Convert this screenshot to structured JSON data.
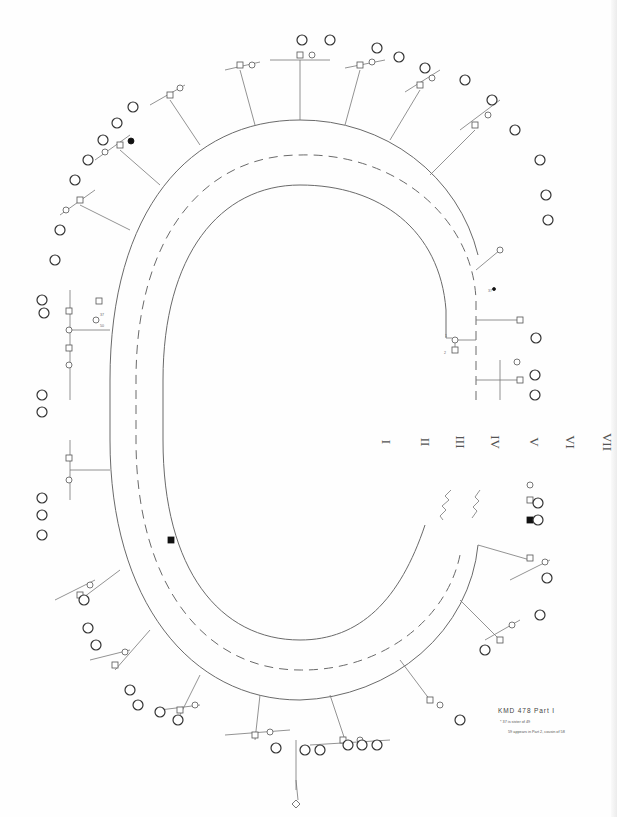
{
  "document": {
    "type": "pedigree-chart",
    "title": "KMD 478 Part I",
    "notes": [
      "* 37 is sister of 49",
      "59 appears in Part 2, cousin of 58"
    ]
  },
  "generations": {
    "labels": [
      "I",
      "II",
      "III",
      "IV",
      "V",
      "VI",
      "VII"
    ]
  },
  "symbols": {
    "male": "square",
    "female": "circle",
    "unknown_sex": "diamond",
    "affected": "filled",
    "tagged_individual": "circled-number"
  },
  "tagged_samples": [
    "102",
    "111",
    "112",
    "103",
    "106",
    "107",
    "108",
    "109",
    "110",
    "113",
    "114",
    "115",
    "116",
    "117",
    "118",
    "119",
    "120",
    "121",
    "122",
    "123",
    "124",
    "125",
    "126",
    "127",
    "128",
    "129",
    "130",
    "131",
    "132",
    "133",
    "134",
    "135",
    "136",
    "137",
    "138",
    "139",
    "140",
    "141",
    "142",
    "143",
    "144",
    "145",
    "146",
    "147",
    "148",
    "149",
    "150"
  ],
  "visible_ids": [
    "1",
    "2",
    "3",
    "4",
    "37",
    "48",
    "49",
    "50",
    "51",
    "52",
    "53",
    "54",
    "55",
    "56",
    "57",
    "58",
    "59",
    "60",
    "61",
    "62",
    "63",
    "64",
    "65",
    "66",
    "67",
    "68",
    "69",
    "70",
    "81",
    "82",
    "84",
    "85",
    "87",
    "88",
    "89",
    "90",
    "91",
    "92",
    "93",
    "94",
    "95",
    "96",
    "97",
    "98",
    "99",
    "100"
  ],
  "colors": {
    "ink": "#555555",
    "affected_fill": "#111111",
    "background": "#fefefe"
  }
}
